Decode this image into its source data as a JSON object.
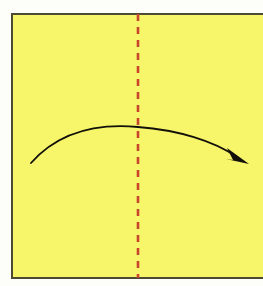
{
  "figure": {
    "canvas": {
      "width": 263,
      "height": 286
    },
    "background_color": "#fdfdfa"
  },
  "paper": {
    "label": "yellow square paper",
    "fill_color": "#f7f56a",
    "border_color": "#4d4a33",
    "border_width": 2,
    "x": 12,
    "y": 14,
    "width": 252,
    "height": 264
  },
  "fold_line": {
    "label": "center vertical valley fold",
    "color": "#c9452b",
    "style": "dashed",
    "dash_length": 7,
    "gap_length": 6,
    "stroke_width": 2.6,
    "x": 138,
    "y_start": 14,
    "y_end": 278
  },
  "fold_arrow": {
    "label": "fold direction arrow",
    "color": "#121008",
    "stroke_width": 1.8,
    "path": "M 31,163 C 62,128 105,124 138,127 C 178,130 214,141 237,157",
    "start_point": {
      "x": 31,
      "y": 163
    },
    "apex_point": {
      "x": 138,
      "y": 127
    },
    "end_point": {
      "x": 237,
      "y": 157
    },
    "arrowhead": {
      "label": "arrowhead",
      "points": "249,164 227,148 233,160 226,159",
      "fill_color": "#121008"
    }
  },
  "accessibility": {
    "alt_text": "Origami instruction: fold the yellow square in half along the vertical center dashed line, bringing the left side over to the right."
  }
}
